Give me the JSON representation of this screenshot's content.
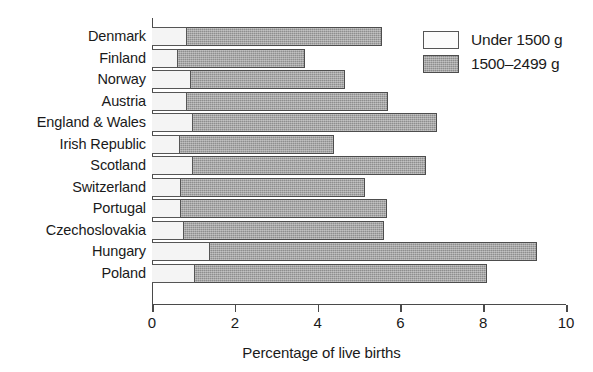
{
  "chart_data": {
    "type": "bar",
    "orientation": "horizontal",
    "stacked": true,
    "title": "",
    "xlabel": "Percentage of live births",
    "ylabel": "",
    "xlim": [
      0,
      10
    ],
    "xticks": [
      0,
      2,
      4,
      6,
      8,
      10
    ],
    "xtick_labels": [
      "0",
      "2",
      "4",
      "6",
      "8",
      "10"
    ],
    "grid": false,
    "legend_position": "top-right",
    "categories": [
      "Denmark",
      "Finland",
      "Norway",
      "Austria",
      "England & Wales",
      "Irish Republic",
      "Scotland",
      "Switzerland",
      "Portugal",
      "Czechoslovakia",
      "Hungary",
      "Poland"
    ],
    "series": [
      {
        "name": "Under 1500 g",
        "color": "#f4f4f4",
        "values": [
          0.85,
          0.63,
          0.95,
          0.85,
          1.0,
          0.67,
          0.98,
          0.69,
          0.71,
          0.77,
          1.39,
          1.05
        ]
      },
      {
        "name": "1500–2499 g",
        "color": "#8e8e8e",
        "values": [
          4.7,
          3.07,
          3.71,
          4.86,
          5.89,
          3.72,
          5.65,
          4.45,
          4.96,
          4.84,
          7.9,
          7.03
        ]
      }
    ],
    "totals": [
      5.55,
      3.7,
      4.66,
      5.71,
      6.89,
      4.39,
      6.63,
      5.14,
      5.67,
      5.61,
      9.29,
      8.08
    ]
  },
  "legend": {
    "items": [
      {
        "label": "Under 1500 g",
        "swatch": "low"
      },
      {
        "label": "1500–2499 g",
        "swatch": "mid"
      }
    ]
  }
}
